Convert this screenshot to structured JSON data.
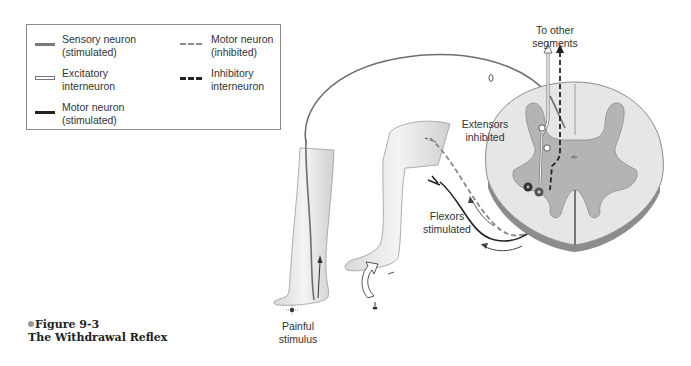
{
  "legend": {
    "items": [
      {
        "key": "sensory",
        "label": "Sensory neuron\n(stimulated)",
        "style": "solid gray line",
        "color": "#7a7a7a"
      },
      {
        "key": "excitatory",
        "label": "Excitatory\ninterneuron",
        "style": "hollow double line",
        "color": "#777777"
      },
      {
        "key": "motor_stim",
        "label": "Motor neuron\n(stimulated)",
        "style": "solid black line",
        "color": "#222222"
      },
      {
        "key": "motor_inh",
        "label": "Motor neuron\n(inhibited)",
        "style": "dashed gray line",
        "color": "#8a8a8a"
      },
      {
        "key": "inh_inter",
        "label": "Inhibitory\ninterneuron",
        "style": "dashed black line",
        "color": "#222222"
      }
    ]
  },
  "labels": {
    "to_other_segments": "To other\nsegments",
    "extensors": "Extensors\ninhibited",
    "flexors": "Flexors\nstimulated",
    "painful": "Painful\nstimulus"
  },
  "caption": {
    "figure": "Figure 9-3",
    "title": "The Withdrawal Reflex"
  },
  "colors": {
    "white_matter": "#e6e6e6",
    "gray_matter": "#b4b4b4",
    "cord_edge": "#8c8c8c",
    "skin": "#ececec"
  }
}
